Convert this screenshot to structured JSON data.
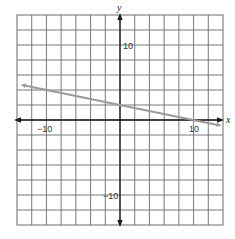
{
  "chart_data": {
    "type": "line",
    "title": "",
    "xlabel": "x",
    "ylabel": "y",
    "xlim": [
      -14,
      14
    ],
    "ylim": [
      -14,
      14
    ],
    "grid": true,
    "grid_step": 2,
    "x_tick_labels": [
      {
        "value": -10,
        "label": "−10"
      },
      {
        "value": 10,
        "label": "10"
      }
    ],
    "y_tick_labels": [
      {
        "value": 10,
        "label": "10"
      },
      {
        "value": -10,
        "label": "−10"
      }
    ],
    "series": [
      {
        "name": "line",
        "equation": "y = -0.2x + 2",
        "slope": -0.2,
        "intercept": 2,
        "x": [
          -13.5,
          -10,
          0,
          10,
          13.8
        ],
        "y": [
          4.7,
          4,
          2,
          0,
          -0.76
        ],
        "color": "#9a9a9a",
        "arrows": "both"
      }
    ],
    "legend": null
  },
  "labels": {
    "x_axis": "x",
    "y_axis": "y",
    "x_neg": "−10",
    "x_pos": "10",
    "y_pos": "10",
    "y_neg": "−10"
  },
  "colors": {
    "grid": "#6a6a6a",
    "axis": "#1a1a1a",
    "line": "#9a9a9a",
    "background": "#ffffff"
  }
}
